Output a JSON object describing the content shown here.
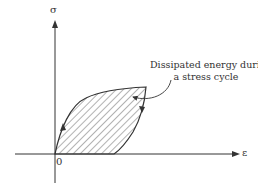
{
  "diagram": {
    "type": "stress-strain hysteresis loop",
    "y_axis_label": "σ",
    "x_axis_label": "ε",
    "origin_label": "0",
    "annotation_line1": "Dissipated energy during",
    "annotation_line2": "a stress cycle",
    "colors": {
      "stroke": "#333333",
      "hatch": "#555555",
      "background": "#ffffff"
    }
  }
}
